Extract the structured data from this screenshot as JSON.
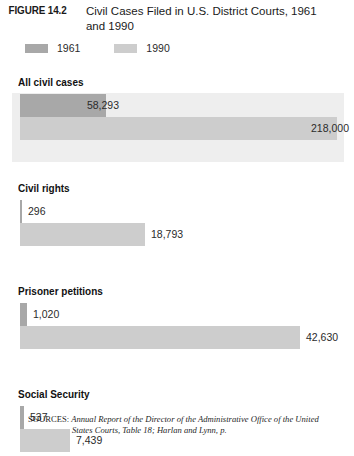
{
  "figure": {
    "number_label": "FIGURE 14.2",
    "title": "Civil Cases Filed in U.S. District Courts, 1961 and 1990"
  },
  "legend": {
    "position": "top-left",
    "entries": [
      {
        "label": "1961",
        "color": "#a8a8a8"
      },
      {
        "label": "1990",
        "color": "#cdcdcd"
      }
    ]
  },
  "colors": {
    "series_1961": "#a8a8a8",
    "series_1990": "#cdcdcd",
    "panel_background": "#eeeeee",
    "value_text": "#2b2b2b",
    "label_text": "#111111"
  },
  "sources": {
    "label": "SOURCES:",
    "title": "Annual Report of the Director of the Administrative Office of the United",
    "continuation": "States Courts, Table 18; Harlan and Lynn, p."
  },
  "chart_data": {
    "type": "bar",
    "orientation": "horizontal",
    "title": "Civil Cases Filed in U.S. District Courts, 1961 and 1990",
    "xlabel": "",
    "ylabel": "",
    "grid": false,
    "legend_position": "top-left",
    "categories": [
      "All civil cases",
      "Civil rights",
      "Prisoner petitions",
      "Social Security"
    ],
    "series": [
      {
        "name": "1961",
        "color": "#a8a8a8",
        "values": [
          58293,
          296,
          1020,
          537
        ],
        "value_labels": [
          "58,293",
          "296",
          "1,020",
          "537"
        ]
      },
      {
        "name": "1990",
        "color": "#cdcdcd",
        "values": [
          218000,
          18793,
          42630,
          7439
        ],
        "value_labels": [
          "218,000",
          "18,793",
          "42,630",
          "7,439"
        ]
      }
    ],
    "groups": [
      {
        "category": "All civil cases",
        "panel": true,
        "bars": [
          {
            "series": "1961",
            "value": 58293,
            "label": "58,293",
            "label_placement": "inside",
            "bar_width_px": 86
          },
          {
            "series": "1990",
            "value": 218000,
            "label": "218,000",
            "label_placement": "inside",
            "bar_width_px": 317
          }
        ]
      },
      {
        "category": "Civil rights",
        "panel": false,
        "bars": [
          {
            "series": "1961",
            "value": 296,
            "label": "296",
            "label_placement": "outside",
            "bar_width_px": 2
          },
          {
            "series": "1990",
            "value": 18793,
            "label": "18,793",
            "label_placement": "outside",
            "bar_width_px": 125
          }
        ]
      },
      {
        "category": "Prisoner petitions",
        "panel": false,
        "bars": [
          {
            "series": "1961",
            "value": 1020,
            "label": "1,020",
            "label_placement": "outside",
            "bar_width_px": 7
          },
          {
            "series": "1990",
            "value": 42630,
            "label": "42,630",
            "label_placement": "outside",
            "bar_width_px": 280
          }
        ]
      },
      {
        "category": "Social Security",
        "panel": false,
        "bars": [
          {
            "series": "1961",
            "value": 537,
            "label": "537",
            "label_placement": "outside",
            "bar_width_px": 4
          },
          {
            "series": "1990",
            "value": 7439,
            "label": "7,439",
            "label_placement": "outside",
            "bar_width_px": 50
          }
        ]
      }
    ]
  }
}
